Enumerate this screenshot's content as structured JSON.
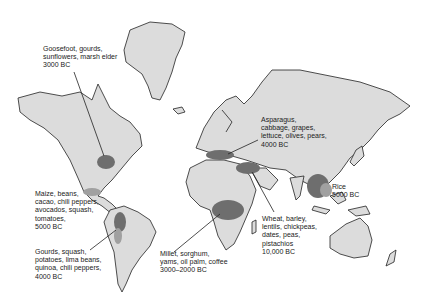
{
  "map": {
    "type": "world origins of domesticated crops",
    "labels": [
      {
        "id": "north-america",
        "lines": [
          "Goosefoot, gourds,",
          "sunflowers, marsh elder",
          "3000 BC"
        ]
      },
      {
        "id": "mesoamerica",
        "lines": [
          "Maize, beans,",
          "cacao, chili peppers,",
          "avocados, squash,",
          "tomatoes,",
          "5000 BC"
        ]
      },
      {
        "id": "south-america",
        "lines": [
          "Gourds, squash,",
          "potatoes, lima beans,",
          "quinoa, chili peppers,",
          "4000 BC"
        ]
      },
      {
        "id": "europe",
        "lines": [
          "Asparagus,",
          "cabbage, grapes,",
          "lettuce, olives, pears,",
          "4000 BC"
        ]
      },
      {
        "id": "africa",
        "lines": [
          "Millet, sorghum,",
          "yams, oil palm, coffee",
          "3000–2000 BC"
        ]
      },
      {
        "id": "fertile-crescent",
        "lines": [
          "Wheat, barley,",
          "lentils, chickpeas,",
          "dates, peas,",
          "pistachios",
          "10,000 BC"
        ]
      },
      {
        "id": "east-asia",
        "lines": [
          "Rice",
          "5000 BC"
        ]
      }
    ],
    "colors": {
      "land": "#dcdcdc",
      "region_dark": "#6e6e6e",
      "region_light": "#a0a0a0",
      "outline": "#222222"
    }
  }
}
